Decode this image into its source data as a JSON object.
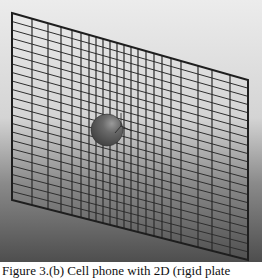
{
  "figure": {
    "background_top": "#e8e8e8",
    "background_bottom": "#555555",
    "line_color": "#2a2a2a",
    "sphere_color": "#5a5a5a",
    "frame": {
      "tl": [
        12,
        13
      ],
      "tr": [
        248,
        80
      ],
      "br": [
        248,
        260
      ],
      "bl": [
        12,
        200
      ]
    },
    "vertical_lines_x": [
      12,
      32,
      48,
      61,
      72,
      81,
      89,
      96,
      103,
      110,
      117,
      124,
      131,
      138,
      146,
      154,
      162,
      171,
      181,
      198,
      212,
      230,
      248
    ],
    "horizontal_line_count": 22,
    "sphere": {
      "cx": 107,
      "cy": 130,
      "r": 16
    }
  },
  "caption": {
    "text": "Figure 3.(b) Cell phone with 2D (rigid plate"
  }
}
